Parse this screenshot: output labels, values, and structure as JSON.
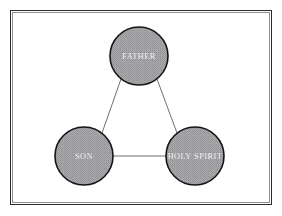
{
  "figure": {
    "type": "triangle-relationship-diagram",
    "frame": {
      "visible": true,
      "border_color": "#2b2b2f",
      "inner_rule_color": "#8f9094",
      "background_color": "#ffffff"
    },
    "nodes": [
      {
        "id": "father",
        "label": "FATHER",
        "position": "top",
        "cx": 139,
        "cy": 56,
        "r": 29,
        "fill_color": "#9d9da1",
        "stroke_color": "#141417",
        "label_color": "#ffffff"
      },
      {
        "id": "son",
        "label": "SON",
        "position": "bottom-left",
        "cx": 84,
        "cy": 156,
        "r": 29,
        "fill_color": "#9d9da1",
        "stroke_color": "#141417",
        "label_color": "#ffffff"
      },
      {
        "id": "holy-spirit",
        "label": "HOLY SPIRIT",
        "position": "bottom-right",
        "cx": 195,
        "cy": 156,
        "r": 29,
        "fill_color": "#9d9da1",
        "stroke_color": "#141417",
        "label_color": "#ffffff"
      }
    ],
    "edges": [
      {
        "id": "father-son",
        "from": "father",
        "to": "son",
        "color": "#6e6f73"
      },
      {
        "id": "father-holy-spirit",
        "from": "father",
        "to": "holy-spirit",
        "color": "#6e6f73"
      },
      {
        "id": "son-holy-spirit",
        "from": "son",
        "to": "holy-spirit",
        "color": "#6e6f73"
      }
    ]
  }
}
